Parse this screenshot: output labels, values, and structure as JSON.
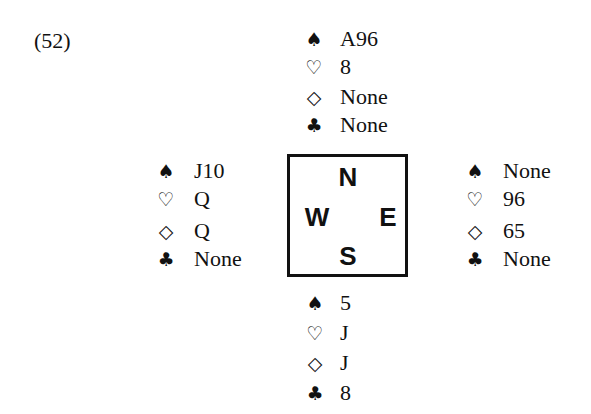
{
  "problem": {
    "number": "(52)"
  },
  "suits": {
    "spades": "♠",
    "hearts": "♡",
    "diamonds": "◇",
    "clubs": "♣"
  },
  "compass": {
    "north": "N",
    "west": "W",
    "east": "E",
    "south": "S"
  },
  "hands": {
    "north": {
      "spades": "A96",
      "hearts": "8",
      "diamonds": "None",
      "clubs": "None"
    },
    "west": {
      "spades": "J10",
      "hearts": "Q",
      "diamonds": "Q",
      "clubs": "None"
    },
    "east": {
      "spades": "None",
      "hearts": "96",
      "diamonds": "65",
      "clubs": "None"
    },
    "south": {
      "spades": "5",
      "hearts": "J",
      "diamonds": "J",
      "clubs": "8"
    }
  }
}
